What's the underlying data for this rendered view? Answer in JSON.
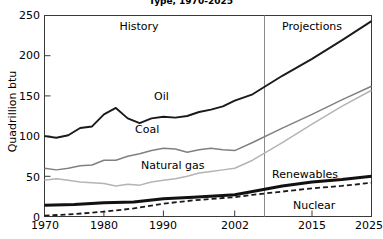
{
  "chart_data": {
    "type": "line",
    "title": "Type, 1970-2025",
    "xlabel": "",
    "ylabel": "Quadrillion btu",
    "ylim": [
      0,
      250
    ],
    "xlim": [
      1970,
      2025
    ],
    "yticks": [
      0,
      50,
      100,
      150,
      200,
      250
    ],
    "xticks": [
      1970,
      1980,
      1990,
      2002,
      2015,
      2025
    ],
    "grid": false,
    "legend_position": "inline-labels",
    "annotations": [
      {
        "text": "History",
        "x": 1986,
        "y": 232
      },
      {
        "text": "Projections",
        "x": 2014,
        "y": 232
      },
      {
        "text": "Oil",
        "x": 1987,
        "y": 158
      },
      {
        "text": "Coal",
        "x": 1986,
        "y": 117
      },
      {
        "text": "Natural gas",
        "x": 1991,
        "y": 72
      },
      {
        "text": "Renewables",
        "x": 2010,
        "y": 57
      },
      {
        "text": "Nuclear",
        "x": 2014,
        "y": 17
      }
    ],
    "divider_x": 2002,
    "series": [
      {
        "name": "Oil",
        "color": "#1a1a1a",
        "style": "solid",
        "width": 1.9,
        "x": [
          1970,
          1972,
          1974,
          1976,
          1978,
          1980,
          1982,
          1984,
          1986,
          1988,
          1990,
          1992,
          1994,
          1996,
          1998,
          2000,
          2002,
          2005,
          2010,
          2015,
          2020,
          2025
        ],
        "values": [
          100,
          98,
          101,
          110,
          112,
          127,
          135,
          122,
          116,
          122,
          124,
          123,
          125,
          130,
          133,
          137,
          144,
          152,
          175,
          196,
          219,
          243
        ]
      },
      {
        "name": "Coal",
        "color": "#808080",
        "style": "solid",
        "width": 1.5,
        "x": [
          1970,
          1972,
          1974,
          1976,
          1978,
          1980,
          1982,
          1984,
          1986,
          1988,
          1990,
          1992,
          1994,
          1996,
          1998,
          2000,
          2002,
          2005,
          2010,
          2015,
          2020,
          2025
        ],
        "values": [
          60,
          58,
          60,
          63,
          64,
          70,
          70,
          75,
          78,
          82,
          85,
          84,
          80,
          83,
          85,
          83,
          82,
          92,
          110,
          127,
          145,
          162
        ]
      },
      {
        "name": "Natural gas",
        "color": "#b4b4b4",
        "style": "solid",
        "width": 1.5,
        "x": [
          1970,
          1972,
          1974,
          1976,
          1978,
          1980,
          1982,
          1984,
          1986,
          1988,
          1990,
          1992,
          1994,
          1996,
          1998,
          2000,
          2002,
          2005,
          2010,
          2015,
          2020,
          2025
        ],
        "values": [
          45,
          47,
          45,
          43,
          42,
          41,
          38,
          40,
          39,
          43,
          45,
          47,
          50,
          54,
          56,
          58,
          60,
          70,
          92,
          115,
          137,
          157
        ]
      },
      {
        "name": "Renewables",
        "color": "#111111",
        "style": "solid",
        "width": 3.0,
        "x": [
          1970,
          1975,
          1980,
          1985,
          1990,
          1995,
          2000,
          2002,
          2005,
          2010,
          2015,
          2020,
          2025
        ],
        "values": [
          14,
          15,
          17,
          18,
          22,
          24,
          26,
          27,
          31,
          38,
          43,
          46,
          50
        ]
      },
      {
        "name": "Nuclear",
        "color": "#1a1a1a",
        "style": "dashed",
        "width": 1.8,
        "x": [
          1970,
          1975,
          1980,
          1985,
          1990,
          1995,
          2000,
          2002,
          2005,
          2010,
          2015,
          2020,
          2025
        ],
        "values": [
          1,
          3,
          6,
          10,
          16,
          20,
          23,
          24,
          27,
          31,
          35,
          38,
          42
        ]
      }
    ]
  }
}
